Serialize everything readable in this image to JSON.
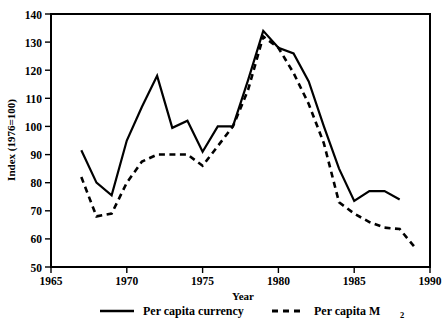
{
  "chart_data": {
    "type": "line",
    "title": "",
    "xlabel": "Year",
    "ylabel": "Index (1976=100)",
    "xlim": [
      1965,
      1990
    ],
    "ylim": [
      50,
      140
    ],
    "xticks": [
      1965,
      1970,
      1975,
      1980,
      1985,
      1990
    ],
    "yticks": [
      50,
      60,
      70,
      80,
      90,
      100,
      110,
      120,
      130,
      140
    ],
    "grid": false,
    "legend_position": "below",
    "series": [
      {
        "name": "Per capita currency",
        "style": "solid",
        "x": [
          1967,
          1968,
          1969,
          1970,
          1971,
          1972,
          1973,
          1974,
          1975,
          1976,
          1977,
          1978,
          1979,
          1980,
          1981,
          1982,
          1983,
          1984,
          1985,
          1986,
          1987,
          1988
        ],
        "values": [
          91.5,
          80.0,
          75.5,
          95.0,
          107.0,
          118.0,
          99.5,
          102.0,
          91.0,
          100.0,
          100.0,
          116.5,
          134.0,
          128.0,
          126.0,
          116.0,
          100.0,
          85.0,
          73.5,
          77.0,
          77.0,
          74.0
        ]
      },
      {
        "name": "Per capita M2",
        "style": "dashed",
        "x": [
          1967,
          1968,
          1969,
          1970,
          1971,
          1972,
          1973,
          1974,
          1975,
          1976,
          1977,
          1978,
          1979,
          1980,
          1981,
          1982,
          1983,
          1984,
          1985,
          1986,
          1987,
          1988,
          1989
        ],
        "values": [
          82.0,
          68.0,
          69.0,
          80.0,
          87.5,
          90.0,
          90.0,
          90.0,
          86.0,
          93.0,
          100.0,
          113.0,
          132.0,
          128.0,
          119.0,
          108.0,
          94.0,
          73.0,
          69.0,
          66.0,
          64.0,
          63.5,
          57.0
        ]
      }
    ]
  },
  "axes": {
    "y_label": "Index (1976=100)",
    "x_label": "Year",
    "y_ticks": [
      "140",
      "130",
      "120",
      "110",
      "100",
      "90",
      "80",
      "70",
      "60",
      "50"
    ],
    "x_ticks": [
      "1965",
      "1970",
      "1975",
      "1980",
      "1985",
      "1990"
    ]
  },
  "legend": {
    "items": [
      {
        "label": "Per capita currency",
        "style": "solid"
      },
      {
        "label": "Per capita M",
        "subscript": "2",
        "style": "dashed"
      }
    ]
  },
  "colors": {
    "ink": "#000000",
    "background": "#ffffff"
  }
}
